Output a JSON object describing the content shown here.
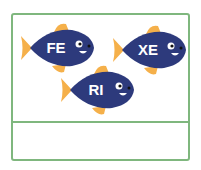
{
  "fish": [
    {
      "label": "FE"
    },
    {
      "label": "XE"
    },
    {
      "label": "RI"
    }
  ],
  "colors": {
    "body": "#2d3a7c",
    "fin": "#f5b04a",
    "border": "#7fb77e"
  }
}
